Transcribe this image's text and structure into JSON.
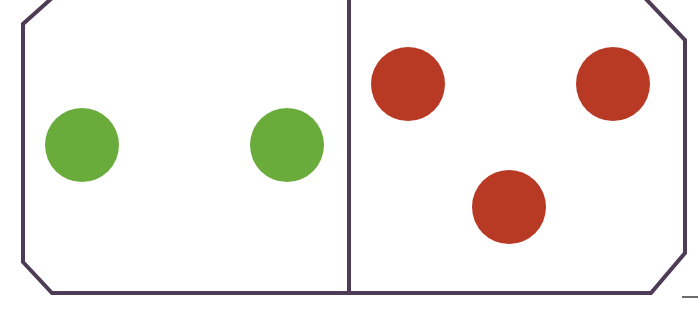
{
  "diagram": {
    "colors": {
      "background": "#ffffff",
      "border": "#4e3b55",
      "green_dot": "#6aac3c",
      "red_dot": "#b83a25"
    },
    "border_width": 4,
    "outline_points": "52,-2 645,-2 685,40 685,253 651,293 52,293 23,262 23,24",
    "divider": {
      "x1": 349,
      "y1": -2,
      "x2": 349,
      "y2": 293
    },
    "left_half": {
      "label": "2",
      "dot_color": "green",
      "dots": [
        {
          "cx": 82,
          "cy": 145,
          "r": 37
        },
        {
          "cx": 287,
          "cy": 145,
          "r": 37
        }
      ]
    },
    "right_half": {
      "label": "3",
      "dot_color": "red",
      "dots": [
        {
          "cx": 408,
          "cy": 84,
          "r": 37
        },
        {
          "cx": 613,
          "cy": 84,
          "r": 37
        },
        {
          "cx": 509,
          "cy": 207,
          "r": 37
        }
      ]
    },
    "stray_mark": {
      "x1": 682,
      "y1": 297,
      "x2": 698,
      "y2": 297
    }
  }
}
